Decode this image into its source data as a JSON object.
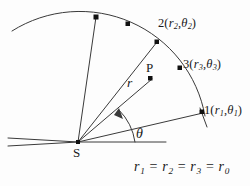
{
  "figure": {
    "background_color": "#fdfdfd",
    "stroke_color": "#3a3a3a",
    "text_color": "#1a1a1a"
  },
  "labels": {
    "vertex": "S",
    "point_p": "P",
    "radius": "r",
    "angle": "θ"
  },
  "arc_points": [
    {
      "id": "point-1",
      "name": "1",
      "r": "r",
      "r_sub": "1",
      "theta": "θ",
      "theta_sub": "1"
    },
    {
      "id": "point-2",
      "name": "2",
      "r": "r",
      "r_sub": "2",
      "theta": "θ",
      "theta_sub": "2"
    },
    {
      "id": "point-3",
      "name": "3",
      "r": "r",
      "r_sub": "3",
      "theta": "θ",
      "theta_sub": "3"
    }
  ],
  "equation": {
    "terms": [
      "r",
      "r",
      "r",
      "r"
    ],
    "subs": [
      "1",
      "2",
      "3",
      "0"
    ],
    "operator": "="
  },
  "geometry": {
    "vertex": {
      "x": 78,
      "y": 142
    },
    "arc_radius": 127,
    "dot_points": [
      {
        "x": 96,
        "y": 17
      },
      {
        "x": 128,
        "y": 24
      },
      {
        "x": 157,
        "y": 42
      },
      {
        "x": 180,
        "y": 68
      },
      {
        "x": 202,
        "y": 112
      },
      {
        "x": 150,
        "y": 78
      }
    ]
  }
}
